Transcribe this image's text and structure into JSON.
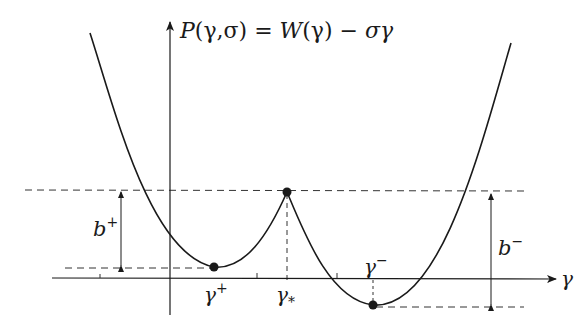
{
  "figure": {
    "title": "P(γ,σ) = W(γ) − σγ",
    "title_parts": {
      "P": "P",
      "args": "(γ,σ)",
      "eq": " = ",
      "W": "W",
      "warg": "(γ)",
      "minus": " − ",
      "tail": "σγ"
    },
    "x_axis_label": "γ",
    "labels": {
      "gamma_plus": "γ",
      "gamma_plus_sup": "+",
      "gamma_star": "γ",
      "gamma_star_sub": "*",
      "gamma_minus": "γ",
      "gamma_minus_sup": "−",
      "b_plus": "b",
      "b_plus_sup": "+",
      "b_minus": "b",
      "b_minus_sup": "−"
    },
    "points": [
      {
        "name": "gamma_plus",
        "role": "local minimum",
        "x": 214,
        "y": 267
      },
      {
        "name": "gamma_star",
        "role": "cusp maximum",
        "x": 287,
        "y": 192
      },
      {
        "name": "gamma_minus",
        "role": "global minimum",
        "x": 373,
        "y": 305
      }
    ],
    "colors": {
      "stroke": "#1a1a1a",
      "dash": "#333333",
      "background": "#ffffff"
    }
  }
}
